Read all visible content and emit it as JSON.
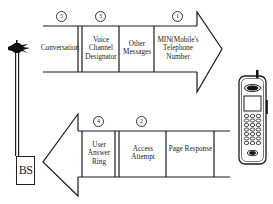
{
  "diagram": {
    "type": "cellular call setup message flow",
    "base_station": {
      "label": "BS"
    },
    "mobile": {
      "label": "mobile phone"
    },
    "forward_arrow": {
      "direction": "right",
      "segments": [
        {
          "number": "5",
          "label": "Conversation"
        },
        {
          "number": "3",
          "label": "Voice Channel Designator"
        },
        {
          "number": "",
          "label": "Other Messages"
        },
        {
          "number": "1",
          "label": "MIN(Mobile's Telephone Number"
        }
      ]
    },
    "reverse_arrow": {
      "direction": "left",
      "segments": [
        {
          "number": "4",
          "label": "User Answer Ring"
        },
        {
          "number": "2",
          "label": "Access Attempt"
        },
        {
          "number": "",
          "label": "Page Response"
        }
      ]
    },
    "colors": {
      "line": "#1a1a1a",
      "background": "#ffffff"
    }
  }
}
